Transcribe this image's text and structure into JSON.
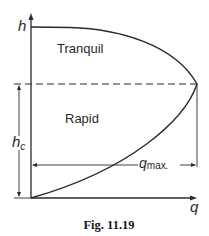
{
  "diagram": {
    "y_axis_label": "h",
    "x_axis_label": "q",
    "region_upper": "Tranquil",
    "region_lower": "Rapid",
    "critical_depth_label_main": "h",
    "critical_depth_label_sub": "c",
    "max_flow_label_main": "q",
    "max_flow_label_sub": "max",
    "max_flow_label_suffix": ".",
    "caption": "Fig. 11.19",
    "colors": {
      "line": "#2a2a2a",
      "background": "#ffffff"
    }
  }
}
